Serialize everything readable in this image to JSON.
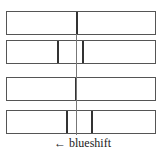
{
  "figure": {
    "type": "spectral-lines-diagram",
    "spectra": [
      {
        "id": "spectrum-1",
        "top": 11,
        "lines_x": [
          76
        ]
      },
      {
        "id": "spectrum-2",
        "top": 40,
        "lines_x": [
          57,
          82
        ]
      },
      {
        "id": "spectrum-3",
        "top": 77,
        "lines_x": [
          75
        ]
      },
      {
        "id": "spectrum-4",
        "top": 110,
        "lines_x": [
          66,
          91
        ]
      }
    ],
    "reference_line_x": 76,
    "label": "← blueshift"
  }
}
